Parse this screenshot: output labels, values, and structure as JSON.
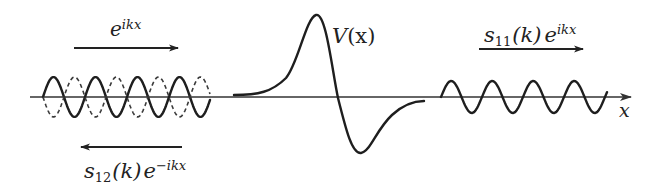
{
  "diagram": {
    "axis": {
      "label": "x",
      "y": 97,
      "x_start": 30,
      "x_end": 632,
      "color": "#333333"
    },
    "potential": {
      "label": "V(x)",
      "label_main": "V",
      "label_arg": "(x)",
      "shape": "peak then trough (antisymmetric bump)",
      "peak": {
        "x": 316,
        "y": 15
      },
      "trough": {
        "x": 361,
        "y": 153
      },
      "zero_crossing_x": 338
    },
    "incident_wave": {
      "label": "e^{ikx}",
      "label_base": "e",
      "label_exp": "ikx",
      "direction": "right",
      "arrow": {
        "x1": 74,
        "x2": 178,
        "y": 48
      },
      "wave": {
        "x_start": 43,
        "x_end": 210,
        "period": 42,
        "amplitude": 20,
        "style": "solid"
      }
    },
    "reflected_wave": {
      "label": "s_{12}(k) e^{-ikx}",
      "label_s": "s",
      "label_sub": "12",
      "label_k": "(k)",
      "label_base": "e",
      "label_exp": "−ikx",
      "direction": "left",
      "arrow": {
        "x1": 80,
        "x2": 182,
        "y": 147
      },
      "wave": {
        "style": "dashed"
      }
    },
    "transmitted_wave": {
      "label": "s_{11}(k) e^{ikx}",
      "label_s": "s",
      "label_sub": "11",
      "label_k": "(k)",
      "label_base": "e",
      "label_exp": "ikx",
      "direction": "right",
      "arrow": {
        "x1": 479,
        "x2": 583,
        "y": 49
      },
      "wave": {
        "x_start": 441,
        "x_end": 607,
        "period": 41,
        "amplitude": 16,
        "style": "solid"
      }
    },
    "colors": {
      "stroke": "#1e1e1e",
      "background": "#ffffff"
    }
  }
}
